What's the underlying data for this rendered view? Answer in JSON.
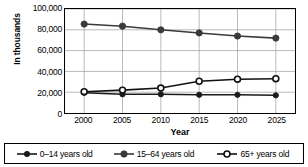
{
  "chart_data": {
    "type": "line",
    "title": "",
    "xlabel": "Year",
    "ylabel": "In thousands",
    "categories": [
      "2000",
      "2005",
      "2010",
      "2015",
      "2020",
      "2025"
    ],
    "x": [
      2000,
      2005,
      2010,
      2015,
      2020,
      2025
    ],
    "ylim": [
      0,
      100000
    ],
    "ytick_values": [
      0,
      20000,
      40000,
      60000,
      80000,
      100000
    ],
    "ytick_labels": [
      "0",
      "20,000",
      "40,000",
      "60,000",
      "80,000",
      "100,000"
    ],
    "grid": true,
    "legend_position": "bottom",
    "series": [
      {
        "name": "0–14 years old",
        "marker": "filled-circle-small",
        "color": "#1a1a1a",
        "values": [
          19500,
          18000,
          18000,
          17500,
          17500,
          17000
        ]
      },
      {
        "name": "15–64 years old",
        "marker": "filled-circle",
        "color": "#3a3a3a",
        "values": [
          85500,
          83500,
          80000,
          77000,
          74000,
          72000
        ]
      },
      {
        "name": "65+ years old",
        "marker": "open-circle",
        "color": "#111111",
        "values": [
          20500,
          22000,
          24000,
          30500,
          32500,
          33000
        ]
      }
    ]
  },
  "legend": {
    "items": [
      {
        "label": "0–14 years old",
        "marker": "filled-circle-small"
      },
      {
        "label": "15–64 years old",
        "marker": "filled-circle"
      },
      {
        "label": "65+ years old",
        "marker": "open-circle"
      }
    ]
  }
}
